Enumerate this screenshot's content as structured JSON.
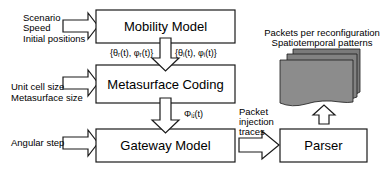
{
  "blocks": {
    "mobility": {
      "label": "Mobility Model"
    },
    "metasurface": {
      "label": "Metasurface Coding"
    },
    "gateway": {
      "label": "Gateway Model"
    },
    "parser": {
      "label": "Parser"
    }
  },
  "inputs": {
    "mobility": [
      "Scenario",
      "Speed",
      "Initial positions"
    ],
    "metasurface": [
      "Unit cell size",
      "Metasurface size"
    ],
    "gateway": [
      "Angular step"
    ]
  },
  "signals": {
    "receiver_angles": "{θᵣ(t), φᵣ(t)}",
    "transmitter_angles": "{θᵢ(t), φᵢ(t)}",
    "phase": "Φᵢⱼ(t)",
    "traces": [
      "Packet",
      "injection",
      "traces"
    ]
  },
  "outputs": {
    "lines": [
      "Packets per reconfiguration",
      "Spatiotemporal patterns"
    ]
  },
  "colors": {
    "stroke": "#1a1a1a",
    "page_fill": "#8c8c8c",
    "page_back": "#7a7a7a"
  }
}
